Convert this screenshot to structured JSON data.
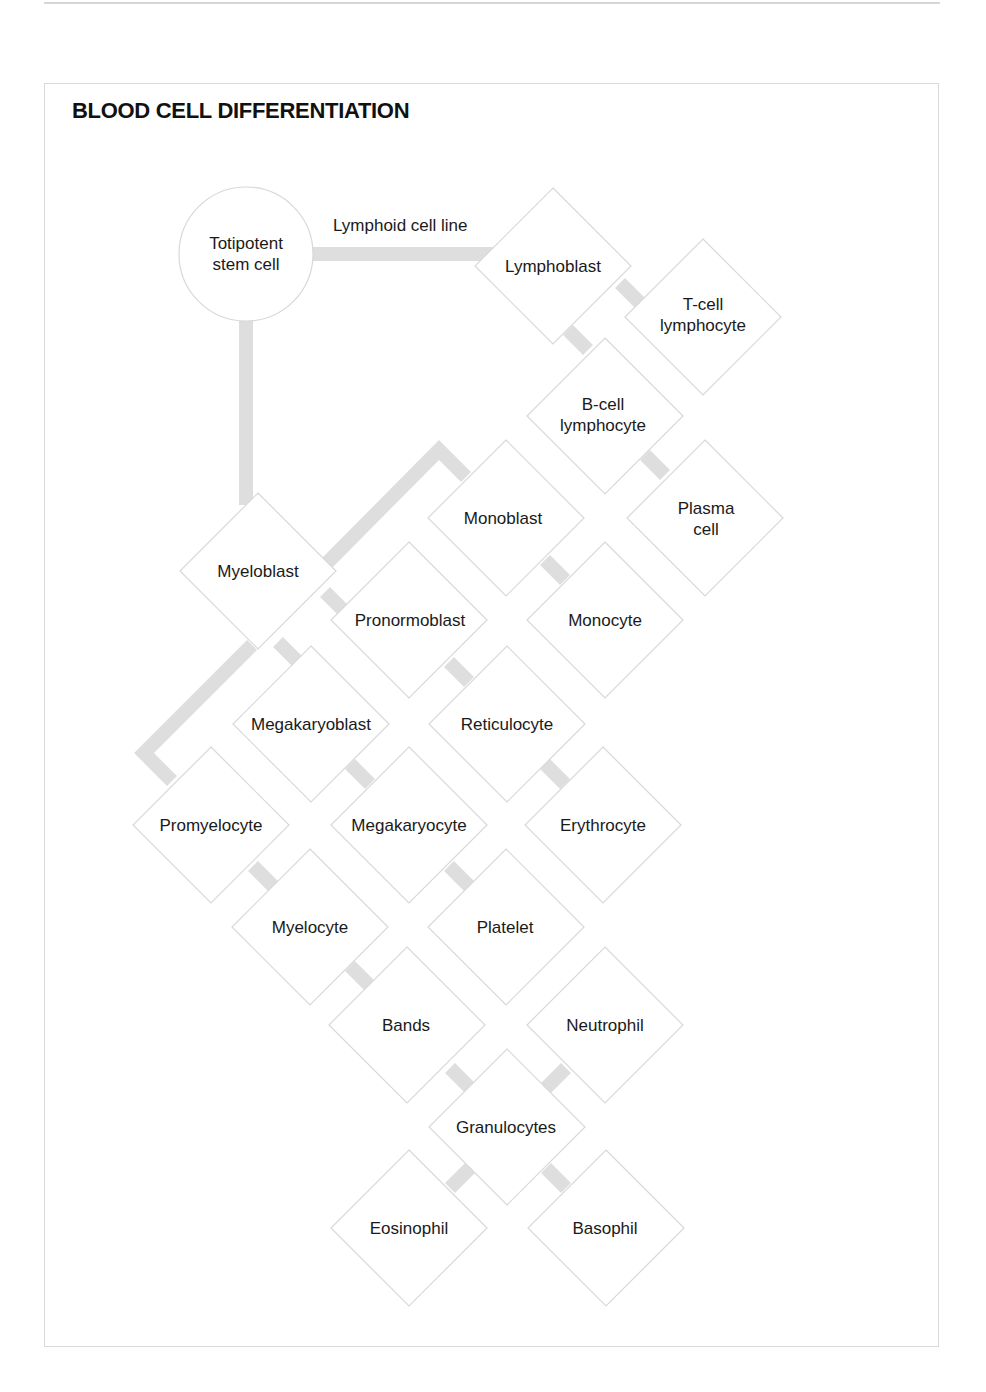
{
  "page": {
    "title": "BLOOD CELL DIFFERENTIATION"
  },
  "colors": {
    "connector": "#dedede",
    "shape_border": "#d8d8d8",
    "text": "#1a1a1a",
    "background": "#ffffff"
  },
  "diagram": {
    "root": {
      "label_line1": "Totipotent",
      "label_line2": "stem cell",
      "shape": "circle",
      "cx": 246,
      "cy": 254,
      "r": 67
    },
    "edge_labels": {
      "lymphoid": "Lymphoid cell line"
    },
    "nodes": {
      "lymphoblast": {
        "line1": "Lymphoblast",
        "line2": "",
        "cx": 553,
        "cy": 266
      },
      "t_cell": {
        "line1": "T-cell",
        "line2": "lymphocyte",
        "cx": 703,
        "cy": 317
      },
      "b_cell": {
        "line1": "B-cell",
        "line2": "lymphocyte",
        "cx": 605,
        "cy": 416
      },
      "plasma": {
        "line1": "Plasma",
        "line2": "cell",
        "cx": 705,
        "cy": 518
      },
      "monoblast": {
        "line1": "Monoblast",
        "line2": "",
        "cx": 506,
        "cy": 518
      },
      "myeloblast": {
        "line1": "Myeloblast",
        "line2": "",
        "cx": 258,
        "cy": 571
      },
      "pronormoblast": {
        "line1": "Pronormoblast",
        "line2": "",
        "cx": 409,
        "cy": 620
      },
      "monocyte": {
        "line1": "Monocyte",
        "line2": "",
        "cx": 605,
        "cy": 620
      },
      "megakaryoblast": {
        "line1": "Megakaryoblast",
        "line2": "",
        "cx": 311,
        "cy": 724
      },
      "reticulocyte": {
        "line1": "Reticulocyte",
        "line2": "",
        "cx": 507,
        "cy": 724
      },
      "promyelocyte": {
        "line1": "Promyelocyte",
        "line2": "",
        "cx": 211,
        "cy": 825
      },
      "megakaryocyte": {
        "line1": "Megakaryocyte",
        "line2": "",
        "cx": 409,
        "cy": 825
      },
      "erythrocyte": {
        "line1": "Erythrocyte",
        "line2": "",
        "cx": 603,
        "cy": 825
      },
      "myelocyte": {
        "line1": "Myelocyte",
        "line2": "",
        "cx": 310,
        "cy": 927
      },
      "platelet": {
        "line1": "Platelet",
        "line2": "",
        "cx": 506,
        "cy": 927
      },
      "bands": {
        "line1": "Bands",
        "line2": "",
        "cx": 407,
        "cy": 1025
      },
      "neutrophil": {
        "line1": "Neutrophil",
        "line2": "",
        "cx": 605,
        "cy": 1025
      },
      "granulocytes": {
        "line1": "Granulocytes",
        "line2": "",
        "cx": 507,
        "cy": 1127
      },
      "eosinophil": {
        "line1": "Eosinophil",
        "line2": "",
        "cx": 409,
        "cy": 1228
      },
      "basophil": {
        "line1": "Basophil",
        "line2": "",
        "cx": 606,
        "cy": 1228
      }
    },
    "edges": [
      [
        "stem_cell",
        "lymphoblast"
      ],
      [
        "stem_cell",
        "myeloblast"
      ],
      [
        "lymphoblast",
        "t_cell"
      ],
      [
        "lymphoblast",
        "b_cell"
      ],
      [
        "b_cell",
        "plasma"
      ],
      [
        "myeloblast",
        "monoblast"
      ],
      [
        "monoblast",
        "monocyte"
      ],
      [
        "myeloblast",
        "pronormoblast"
      ],
      [
        "pronormoblast",
        "reticulocyte"
      ],
      [
        "reticulocyte",
        "erythrocyte"
      ],
      [
        "myeloblast",
        "megakaryoblast"
      ],
      [
        "megakaryoblast",
        "megakaryocyte"
      ],
      [
        "megakaryocyte",
        "platelet"
      ],
      [
        "myeloblast",
        "promyelocyte"
      ],
      [
        "promyelocyte",
        "myelocyte"
      ],
      [
        "myelocyte",
        "bands"
      ],
      [
        "bands",
        "granulocytes"
      ],
      [
        "neutrophil",
        "granulocytes"
      ],
      [
        "granulocytes",
        "eosinophil"
      ],
      [
        "granulocytes",
        "basophil"
      ]
    ]
  }
}
